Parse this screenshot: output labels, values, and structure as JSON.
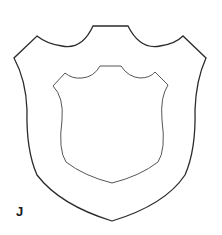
{
  "figure": {
    "label": "J",
    "stroke_outer": "#2b2b2b",
    "stroke_inner": "#555555",
    "background": "#ffffff"
  }
}
